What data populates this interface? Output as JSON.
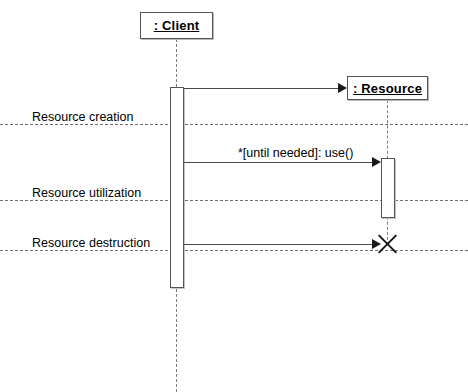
{
  "diagram": {
    "type": "uml-sequence-diagram",
    "width": 468,
    "height": 392,
    "background_color": "#ffffff",
    "line_color": "#4a4a4a",
    "text_color": "#000000"
  },
  "lifelines": [
    {
      "id": "client",
      "label": ": Client",
      "role": "caller",
      "created_at_start": true,
      "destroyed": false
    },
    {
      "id": "resource",
      "label": ": Resource",
      "role": "callee",
      "created_at_start": false,
      "destroyed": true
    }
  ],
  "phases": [
    {
      "id": "creation",
      "label": "Resource creation"
    },
    {
      "id": "utilization",
      "label": "Resource utilization"
    },
    {
      "id": "destruction",
      "label": "Resource destruction"
    }
  ],
  "messages": [
    {
      "id": "create",
      "label": "",
      "from": "client",
      "to": "resource",
      "kind": "create"
    },
    {
      "id": "use",
      "label": "*[until needed]: use()",
      "from": "client",
      "to": "resource",
      "kind": "synchronous-call",
      "iteration": "*",
      "guard": "[until needed]",
      "operation": "use()"
    },
    {
      "id": "destroy",
      "label": "",
      "from": "client",
      "to": "resource",
      "kind": "destroy"
    }
  ]
}
